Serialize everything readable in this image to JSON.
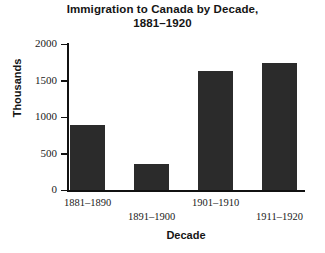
{
  "chart_data": {
    "type": "bar",
    "title": "Immigration to Canada by Decade, 1881–1920",
    "title_line1": "Immigration to Canada by Decade,",
    "title_line2": "1881–1920",
    "xlabel": "Decade",
    "ylabel": "Thousands",
    "categories": [
      "1881–1890",
      "1891–1900",
      "1901–1910",
      "1911–1920"
    ],
    "values": [
      890,
      350,
      1630,
      1740
    ],
    "ylim": [
      0,
      2000
    ],
    "yticks": [
      0,
      500,
      1000,
      1500,
      2000
    ],
    "ytick_labels": [
      "0",
      "500",
      "1000",
      "1500",
      "2000"
    ],
    "grid": false,
    "legend": null,
    "bar_color": "#2b2b2b",
    "axis_color": "#111111",
    "background_color": "#ffffff",
    "xtick_label_layout": "staggered-two-rows"
  }
}
